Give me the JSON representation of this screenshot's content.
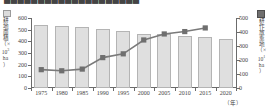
{
  "header": {
    "clipped_title": "████████████████████"
  },
  "axes": {
    "left": {
      "label_chars": [
        "耕",
        "地",
        "面",
        "積"
      ],
      "unit_open": "（×",
      "unit_pow_base": "10",
      "unit_pow_exp": "3",
      "unit_ha": "ha",
      "unit_close": "）",
      "ticks": [
        "600",
        "500",
        "400",
        "300",
        "200",
        "100",
        "0"
      ]
    },
    "right": {
      "label_chars": [
        "耕",
        "作",
        "放",
        "棄",
        "地"
      ],
      "unit_open": "（×",
      "unit_pow_base": "10",
      "unit_pow_exp": "1",
      "unit_ha": "ha",
      "unit_close": "）",
      "ticks": [
        "500",
        "400",
        "300",
        "200",
        "100",
        "0"
      ]
    },
    "x": {
      "ticks": [
        "1975",
        "1980",
        "1985",
        "1990",
        "1995",
        "2000",
        "2005",
        "2010",
        "2015",
        "2020"
      ],
      "unit": "（年）"
    }
  },
  "legend": {
    "bar_marker": "bar-swatch",
    "line_marker": "square-marker"
  },
  "colors": {
    "bar_fill": "#dfdfdf",
    "bar_stroke": "#b4b4b4",
    "line": "#7a7a7a",
    "marker": "#6f6f6f",
    "axis": "#6b6b6b",
    "text": "#3f3f3f"
  },
  "chart_data": {
    "type": "bar",
    "title": "",
    "subtitle": "",
    "xlabel": "（年）",
    "categories": [
      "1975",
      "1980",
      "1985",
      "1990",
      "1995",
      "2000",
      "2005",
      "2010",
      "2015",
      "2020"
    ],
    "grid": false,
    "legend_position": "axis-labels",
    "series": [
      {
        "name": "耕地面積（×10³ha）",
        "type": "bar",
        "axis": "left",
        "values": [
          540,
          528,
          522,
          508,
          487,
          465,
          462,
          446,
          436,
          423
        ],
        "ylim": [
          0,
          600
        ],
        "ytick_step": 100,
        "ylabel": "耕地面積（×10³ha）"
      },
      {
        "name": "耕作放棄地（×10¹ha）",
        "type": "line",
        "axis": "right",
        "values": [
          131,
          123,
          135,
          217,
          244,
          343,
          386,
          403,
          429,
          null
        ],
        "ylim": [
          0,
          500
        ],
        "ytick_step": 100,
        "ylabel": "耕作放棄地（×10¹ha）"
      }
    ]
  }
}
